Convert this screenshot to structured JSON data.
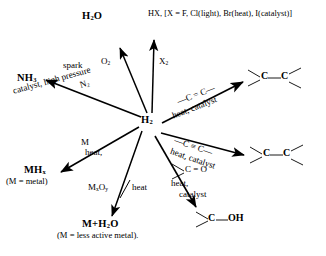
{
  "diagram": {
    "center": {
      "formula": "H",
      "sub": "2",
      "label": "H2"
    },
    "ink_color": "#000000",
    "background_color": "#ffffff",
    "products": {
      "water": {
        "text": "H",
        "sub": "2",
        "text2": "O",
        "label": "H2O"
      },
      "hydrogen_halide": {
        "label": "HX, [X = F, Cl(light), Br(heat), I(catalyst)]"
      },
      "ammonia": {
        "text": "NH",
        "sub": "3",
        "label": "NH3"
      },
      "metal_hydride": {
        "text": "MH",
        "sub": "x",
        "label": "MHx"
      },
      "metal_hydride_note": {
        "label": "(M = metal)"
      },
      "metal_plus_water": {
        "label": "M+H2O",
        "pre": "M+H",
        "sub": "2",
        "post": "O"
      },
      "metal_plus_water_note": {
        "label": "(M = less active metal)."
      },
      "alkane_top": {
        "label": "C—C alkane (tetravalent)"
      },
      "alkane_bottom": {
        "label": "C—C alkane from alkyne"
      },
      "alcohol": {
        "label": "C—OH",
        "c": "C",
        "oh": "OH"
      }
    },
    "reagents": {
      "spark": {
        "label": "spark"
      },
      "oxygen": {
        "text": "O",
        "sub": "2",
        "label": "O2"
      },
      "halogen": {
        "text": "X",
        "sub": "2",
        "label": "X2"
      },
      "nitrogen": {
        "text": "N",
        "sub": "2",
        "label": "N2"
      },
      "ammonia_conditions": {
        "label": "catalyst, high pressure"
      },
      "metal": {
        "label": "M"
      },
      "metal_heat": {
        "label": "heat,"
      },
      "metal_oxide": {
        "pre": "M",
        "sub1": "x",
        "mid": "O",
        "sub2": "y",
        "label": "MxOy"
      },
      "metal_oxide_heat": {
        "label": "heat"
      },
      "alkene": {
        "label": "—C = C—"
      },
      "alkene_conditions": {
        "label": "heat, catalyst"
      },
      "alkyne": {
        "label": "—C ≡ C—"
      },
      "alkyne_conditions": {
        "label": "heat, catalyst"
      },
      "carbonyl": {
        "label": "C = O"
      },
      "carbonyl_heat": {
        "label": "heat,"
      },
      "carbonyl_catalyst": {
        "label": "catalyst"
      }
    }
  }
}
